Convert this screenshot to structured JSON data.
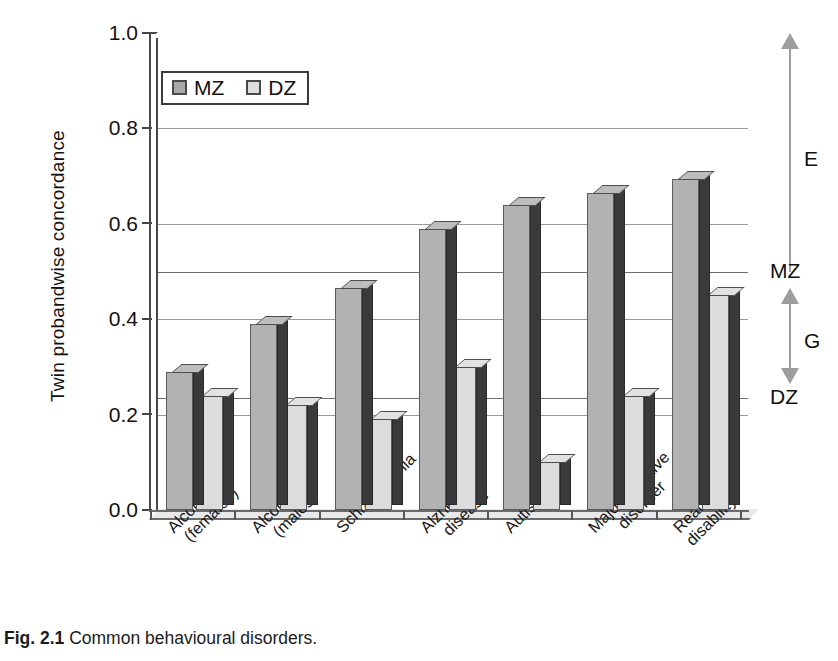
{
  "chart_data": {
    "type": "bar",
    "title": "",
    "xlabel": "",
    "ylabel": "Twin probandwise concordance",
    "ylim": [
      0.0,
      1.0
    ],
    "yticks": [
      "0.0",
      "0.2",
      "0.4",
      "0.6",
      "0.8",
      "1.0"
    ],
    "ytick_values": [
      0.0,
      0.2,
      0.4,
      0.6,
      0.8,
      1.0
    ],
    "grid": true,
    "legend_position": "top-left",
    "categories": [
      "Alcoholism (females)",
      "Alcoholism (males)",
      "Schizophrenia",
      "Alzheimer's disease",
      "Autism",
      "Major affective disorder",
      "Reading disability"
    ],
    "category_lines": [
      [
        "Alcoholism",
        "(females)"
      ],
      [
        "Alcoholism",
        "(males)"
      ],
      [
        "Schizophrenia",
        ""
      ],
      [
        "Alzheimer's",
        "disease"
      ],
      [
        "Autism",
        ""
      ],
      [
        "Major affective",
        "disorder"
      ],
      [
        "Reading",
        "disability"
      ]
    ],
    "series": [
      {
        "name": "MZ",
        "color": "#b2b2b2",
        "values": [
          0.29,
          0.39,
          0.465,
          0.59,
          0.64,
          0.665,
          0.695
        ]
      },
      {
        "name": "DZ",
        "color": "#dcdcdc",
        "values": [
          0.24,
          0.22,
          0.19,
          0.3,
          0.1,
          0.24,
          0.45
        ]
      }
    ],
    "reference_lines": [
      {
        "label": "MZ",
        "value": 0.5
      },
      {
        "label": "DZ",
        "value": 0.235
      }
    ],
    "annotations": [
      {
        "label": "E",
        "from": 0.5,
        "to": 1.0,
        "arrow": "up"
      },
      {
        "label": "G",
        "from": 0.235,
        "to": 0.5,
        "arrow": "both"
      }
    ]
  },
  "legend": {
    "entries": [
      {
        "label": "MZ",
        "swatch": "mz"
      },
      {
        "label": "DZ",
        "swatch": "dz"
      }
    ]
  },
  "caption": {
    "figure_number": "Fig. 2.1",
    "text": "Common behavioural disorders."
  }
}
